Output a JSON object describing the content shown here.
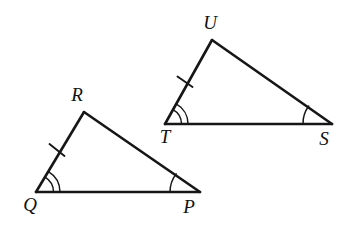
{
  "diagram": {
    "type": "geometry-figure",
    "stroke_color": "#161616",
    "background_color": "#ffffff",
    "label_color": "#111111",
    "triangles": [
      {
        "name": "triangle-PQR",
        "vertices": [
          {
            "label": "Q",
            "x": 36,
            "y": 192,
            "label_x": 30,
            "label_y": 211
          },
          {
            "label": "P",
            "x": 200,
            "y": 192,
            "label_x": 189,
            "label_y": 213
          },
          {
            "label": "R",
            "x": 84,
            "y": 112,
            "label_x": 77,
            "label_y": 101
          }
        ],
        "edges": [
          {
            "name": "edge-QR",
            "from": "Q",
            "to": "R"
          },
          {
            "name": "edge-RP",
            "from": "R",
            "to": "P"
          },
          {
            "name": "edge-QP",
            "from": "Q",
            "to": "P"
          }
        ],
        "angle_marks": [
          {
            "name": "angle-mark-Q",
            "vertex": "Q",
            "arcs": 2
          },
          {
            "name": "angle-mark-P",
            "vertex": "P",
            "arcs": 1
          }
        ],
        "tick_marks": [
          {
            "name": "tick-QR",
            "edge": "edge-QR",
            "count": 1,
            "x": 57,
            "y": 150
          }
        ]
      },
      {
        "name": "triangle-STU",
        "vertices": [
          {
            "label": "T",
            "x": 165,
            "y": 124,
            "label_x": 159,
            "label_y": 143
          },
          {
            "label": "S",
            "x": 332,
            "y": 124,
            "label_x": 320,
            "label_y": 145
          },
          {
            "label": "U",
            "x": 212,
            "y": 40,
            "label_x": 205,
            "label_y": 29
          }
        ],
        "edges": [
          {
            "name": "edge-TU",
            "from": "T",
            "to": "U"
          },
          {
            "name": "edge-US",
            "from": "U",
            "to": "S"
          },
          {
            "name": "edge-TS",
            "from": "T",
            "to": "S"
          }
        ],
        "angle_marks": [
          {
            "name": "angle-mark-T",
            "vertex": "T",
            "arcs": 2
          },
          {
            "name": "angle-mark-S",
            "vertex": "S",
            "arcs": 1
          }
        ],
        "tick_marks": [
          {
            "name": "tick-TU",
            "edge": "edge-TU",
            "count": 1,
            "x": 185,
            "y": 82
          }
        ]
      }
    ],
    "labels": {
      "P": "P",
      "Q": "Q",
      "R": "R",
      "S": "S",
      "T": "T",
      "U": "U"
    }
  }
}
